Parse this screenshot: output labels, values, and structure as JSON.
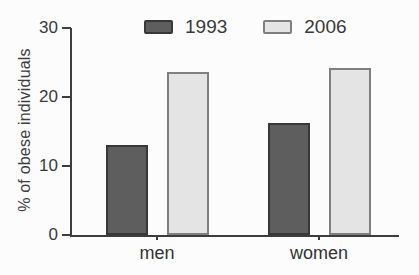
{
  "figure": {
    "background": "#fcfcfc"
  },
  "colors": {
    "axis": "#3d3d3d",
    "text": "#3a3a3a"
  },
  "chart_data": {
    "type": "bar",
    "title": "",
    "xlabel": "",
    "ylabel": "% of obese individuals",
    "categories": [
      "men",
      "women"
    ],
    "series": [
      {
        "name": "1993",
        "values": [
          13.0,
          16.3
        ],
        "color": "#5e5e5e",
        "border": "#383838"
      },
      {
        "name": "2006",
        "values": [
          23.7,
          24.2
        ],
        "color": "#e4e4e4",
        "border": "#7f7f7f"
      }
    ],
    "ylim": [
      0,
      30
    ],
    "yticks": [
      0,
      10,
      20,
      30
    ],
    "grid": false,
    "legend_position": "top"
  }
}
